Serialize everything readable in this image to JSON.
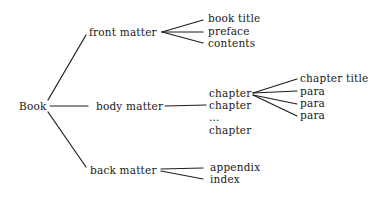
{
  "diagram": {
    "type": "tree",
    "root": {
      "id": "book",
      "label": "Book",
      "x": 19,
      "y": 106
    },
    "nodes": [
      {
        "id": "front-matter",
        "label": "front matter",
        "x": 89,
        "y": 32
      },
      {
        "id": "body-matter",
        "label": "body matter",
        "x": 96,
        "y": 106
      },
      {
        "id": "back-matter",
        "label": "back matter",
        "x": 90,
        "y": 170
      },
      {
        "id": "book-title",
        "label": "book title",
        "x": 208,
        "y": 18
      },
      {
        "id": "preface",
        "label": "preface",
        "x": 208,
        "y": 31
      },
      {
        "id": "contents",
        "label": "contents",
        "x": 208,
        "y": 43
      },
      {
        "id": "chapter-1",
        "label": "chapter",
        "x": 209,
        "y": 93
      },
      {
        "id": "chapter-2",
        "label": "chapter",
        "x": 209,
        "y": 105
      },
      {
        "id": "ellipsis",
        "label": "...",
        "x": 209,
        "y": 117
      },
      {
        "id": "chapter-n",
        "label": "chapter",
        "x": 209,
        "y": 130
      },
      {
        "id": "chapter-title",
        "label": "chapter title",
        "x": 300,
        "y": 78
      },
      {
        "id": "para-1",
        "label": "para",
        "x": 300,
        "y": 91
      },
      {
        "id": "para-2",
        "label": "para",
        "x": 300,
        "y": 103
      },
      {
        "id": "para-3",
        "label": "para",
        "x": 300,
        "y": 115
      },
      {
        "id": "appendix",
        "label": "appendix",
        "x": 210,
        "y": 167
      },
      {
        "id": "index",
        "label": "index",
        "x": 210,
        "y": 179
      }
    ],
    "edges": [
      {
        "from": "book",
        "to": "front-matter",
        "x1": 48,
        "y1": 100,
        "x2": 86,
        "y2": 35
      },
      {
        "from": "book",
        "to": "body-matter",
        "x1": 50,
        "y1": 106,
        "x2": 88,
        "y2": 106
      },
      {
        "from": "book",
        "to": "back-matter",
        "x1": 48,
        "y1": 112,
        "x2": 86,
        "y2": 167
      },
      {
        "from": "front-matter",
        "to": "book-title",
        "x1": 162,
        "y1": 32,
        "x2": 203,
        "y2": 20
      },
      {
        "from": "front-matter",
        "to": "preface",
        "x1": 162,
        "y1": 32,
        "x2": 203,
        "y2": 32
      },
      {
        "from": "front-matter",
        "to": "contents",
        "x1": 162,
        "y1": 32,
        "x2": 203,
        "y2": 43
      },
      {
        "from": "body-matter",
        "to": "chapter-2",
        "x1": 165,
        "y1": 106,
        "x2": 206,
        "y2": 105
      },
      {
        "from": "chapter-1",
        "to": "chapter-title",
        "x1": 253,
        "y1": 93,
        "x2": 297,
        "y2": 79
      },
      {
        "from": "chapter-1",
        "to": "para-1",
        "x1": 253,
        "y1": 93,
        "x2": 297,
        "y2": 91
      },
      {
        "from": "chapter-1",
        "to": "para-2",
        "x1": 253,
        "y1": 95,
        "x2": 297,
        "y2": 104
      },
      {
        "from": "chapter-1",
        "to": "para-3",
        "x1": 253,
        "y1": 95,
        "x2": 297,
        "y2": 116
      },
      {
        "from": "back-matter",
        "to": "appendix",
        "x1": 161,
        "y1": 169,
        "x2": 203,
        "y2": 168
      },
      {
        "from": "back-matter",
        "to": "index",
        "x1": 161,
        "y1": 171,
        "x2": 203,
        "y2": 179
      }
    ]
  }
}
